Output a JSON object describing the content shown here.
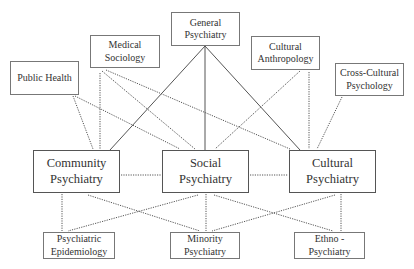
{
  "diagram": {
    "top_row": [
      {
        "id": "public_health",
        "label": "Public Health",
        "x": 10,
        "y": 61,
        "w": 69,
        "h": 34
      },
      {
        "id": "medical_sociology",
        "label": "Medical\nSociology",
        "x": 90,
        "y": 35,
        "w": 70,
        "h": 33
      },
      {
        "id": "general_psychiatry",
        "label": "General\nPsychiatry",
        "x": 171,
        "y": 12,
        "w": 69,
        "h": 34
      },
      {
        "id": "cultural_anthropology",
        "label": "Cultural\nAnthropology",
        "x": 251,
        "y": 36,
        "w": 69,
        "h": 34
      },
      {
        "id": "cross_cultural_psychology",
        "label": "Cross-Cultural\nPsychology",
        "x": 335,
        "y": 63,
        "w": 69,
        "h": 33
      }
    ],
    "middle_row": [
      {
        "id": "community_psychiatry",
        "label": "Community\nPsychiatry",
        "x": 33,
        "y": 150,
        "w": 87,
        "h": 43
      },
      {
        "id": "social_psychiatry",
        "label": "Social\nPsychiatry",
        "x": 162,
        "y": 150,
        "w": 87,
        "h": 43
      },
      {
        "id": "cultural_psychiatry",
        "label": "Cultural\nPsychiatry",
        "x": 289,
        "y": 150,
        "w": 87,
        "h": 43
      }
    ],
    "bottom_row": [
      {
        "id": "psychiatric_epidemiology",
        "label": "Psychiatric\nEpidemiology",
        "x": 43,
        "y": 232,
        "w": 72,
        "h": 27
      },
      {
        "id": "minority_psychiatry",
        "label": "Minority\nPsychiatry",
        "x": 170,
        "y": 232,
        "w": 70,
        "h": 27
      },
      {
        "id": "ethno_psychiatry",
        "label": "Ethno -\nPsychiatry",
        "x": 294,
        "y": 232,
        "w": 71,
        "h": 27
      }
    ],
    "links": [
      {
        "from": "general_psychiatry",
        "to": "community_psychiatry",
        "style": "solid",
        "x1": 205,
        "y1": 46,
        "x2": 110,
        "y2": 150
      },
      {
        "from": "general_psychiatry",
        "to": "social_psychiatry",
        "style": "solid",
        "x1": 205,
        "y1": 46,
        "x2": 205,
        "y2": 150
      },
      {
        "from": "general_psychiatry",
        "to": "cultural_psychiatry",
        "style": "solid",
        "x1": 205,
        "y1": 46,
        "x2": 300,
        "y2": 150
      },
      {
        "from": "public_health",
        "to": "community_psychiatry",
        "style": "dotted",
        "x1": 73,
        "y1": 96,
        "x2": 93,
        "y2": 149
      },
      {
        "from": "public_health",
        "to": "social_psychiatry",
        "style": "dotted",
        "x1": 75,
        "y1": 96,
        "x2": 180,
        "y2": 149
      },
      {
        "from": "medical_sociology",
        "to": "community_psychiatry",
        "style": "dotted",
        "x1": 100,
        "y1": 73,
        "x2": 100,
        "y2": 149
      },
      {
        "from": "medical_sociology",
        "to": "social_psychiatry",
        "style": "dotted",
        "x1": 102,
        "y1": 71,
        "x2": 195,
        "y2": 149
      },
      {
        "from": "medical_sociology",
        "to": "cultural_psychiatry",
        "style": "dotted",
        "x1": 106,
        "y1": 70,
        "x2": 290,
        "y2": 149
      },
      {
        "from": "cultural_anthropology",
        "to": "social_psychiatry",
        "style": "dotted",
        "x1": 300,
        "y1": 71,
        "x2": 215,
        "y2": 149
      },
      {
        "from": "cultural_anthropology",
        "to": "cultural_psychiatry",
        "style": "dotted",
        "x1": 309,
        "y1": 72,
        "x2": 309,
        "y2": 149
      },
      {
        "from": "cross_cultural_psychology",
        "to": "cultural_psychiatry",
        "style": "dotted",
        "x1": 342,
        "y1": 97,
        "x2": 317,
        "y2": 149
      },
      {
        "from": "community_psychiatry",
        "to": "social_psychiatry",
        "style": "dotted",
        "x1": 121,
        "y1": 175,
        "x2": 161,
        "y2": 175
      },
      {
        "from": "social_psychiatry",
        "to": "cultural_psychiatry",
        "style": "dotted",
        "x1": 250,
        "y1": 175,
        "x2": 288,
        "y2": 175
      },
      {
        "from": "community_psychiatry",
        "to": "psychiatric_epidemiology",
        "style": "dotted",
        "x1": 62,
        "y1": 194,
        "x2": 62,
        "y2": 231
      },
      {
        "from": "community_psychiatry",
        "to": "minority_psychiatry",
        "style": "dotted",
        "x1": 88,
        "y1": 195,
        "x2": 200,
        "y2": 231
      },
      {
        "from": "social_psychiatry",
        "to": "psychiatric_epidemiology",
        "style": "dotted",
        "x1": 198,
        "y1": 195,
        "x2": 68,
        "y2": 231
      },
      {
        "from": "social_psychiatry",
        "to": "minority_psychiatry",
        "style": "dotted",
        "x1": 206,
        "y1": 194,
        "x2": 206,
        "y2": 231
      },
      {
        "from": "social_psychiatry",
        "to": "ethno_psychiatry",
        "style": "dotted",
        "x1": 214,
        "y1": 195,
        "x2": 333,
        "y2": 231
      },
      {
        "from": "cultural_psychiatry",
        "to": "minority_psychiatry",
        "style": "dotted",
        "x1": 335,
        "y1": 195,
        "x2": 212,
        "y2": 231
      },
      {
        "from": "cultural_psychiatry",
        "to": "ethno_psychiatry",
        "style": "dotted",
        "x1": 341,
        "y1": 194,
        "x2": 341,
        "y2": 231
      }
    ],
    "colors": {
      "line": "#555555",
      "border": "#666666",
      "text": "#333333"
    }
  }
}
